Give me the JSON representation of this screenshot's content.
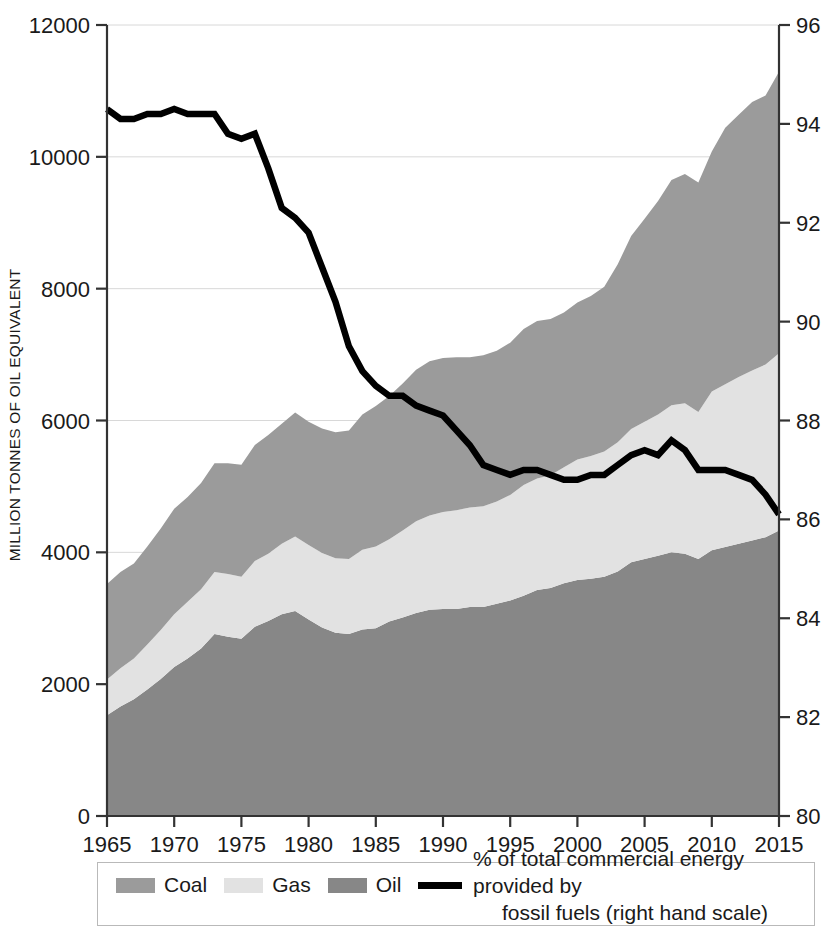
{
  "axes": {
    "left_title": "MILLION TONNES OF OIL EQUIVALENT",
    "left_ticks": [
      "0",
      "2000",
      "4000",
      "6000",
      "8000",
      "10000",
      "12000"
    ],
    "right_ticks": [
      "80",
      "82",
      "84",
      "86",
      "88",
      "90",
      "92",
      "94",
      "96"
    ],
    "x_ticks": [
      "1965",
      "1970",
      "1975",
      "1980",
      "1985",
      "1990",
      "1995",
      "2000",
      "2005",
      "2010",
      "2015"
    ]
  },
  "legend": {
    "coal_label": "Coal",
    "gas_label": "Gas",
    "oil_label": "Oil",
    "line_label_line1": "% of total commercial energy provided by",
    "line_label_line2": "fossil fuels (right hand scale)"
  },
  "colors": {
    "coal": "#9b9b9b",
    "gas": "#e2e2e2",
    "oil": "#878787",
    "line": "#000000",
    "axis": "#333333",
    "grid": "#d8d8d8"
  },
  "chart_data": {
    "type": "area",
    "title": "",
    "subtitle": "",
    "xlabel": "",
    "ylabel": "MILLION TONNES OF OIL EQUIVALENT",
    "y2label": "",
    "xlim": [
      1965,
      2015
    ],
    "ylim": [
      0,
      12000
    ],
    "y2lim": [
      80,
      96
    ],
    "grid": true,
    "legend_position": "bottom",
    "stacking": "stacked-area, bottom-to-top: Oil, Gas, Coal",
    "x": [
      1965,
      1966,
      1967,
      1968,
      1969,
      1970,
      1971,
      1972,
      1973,
      1974,
      1975,
      1976,
      1977,
      1978,
      1979,
      1980,
      1981,
      1982,
      1983,
      1984,
      1985,
      1986,
      1987,
      1988,
      1989,
      1990,
      1991,
      1992,
      1993,
      1994,
      1995,
      1996,
      1997,
      1998,
      1999,
      2000,
      2001,
      2002,
      2003,
      2004,
      2005,
      2006,
      2007,
      2008,
      2009,
      2010,
      2011,
      2012,
      2013,
      2014,
      2015
    ],
    "series": [
      {
        "name": "Oil",
        "color": "#878787",
        "values": [
          1530,
          1660,
          1770,
          1920,
          2080,
          2260,
          2390,
          2540,
          2760,
          2720,
          2690,
          2870,
          2960,
          3060,
          3110,
          2980,
          2860,
          2780,
          2760,
          2830,
          2850,
          2950,
          3010,
          3080,
          3130,
          3140,
          3140,
          3170,
          3170,
          3220,
          3270,
          3340,
          3430,
          3460,
          3530,
          3580,
          3600,
          3630,
          3710,
          3850,
          3900,
          3950,
          4000,
          3980,
          3900,
          4030,
          4080,
          4130,
          4180,
          4230,
          4330
        ]
      },
      {
        "name": "Gas",
        "color": "#e2e2e2",
        "values": [
          540,
          580,
          620,
          680,
          740,
          800,
          860,
          900,
          940,
          950,
          940,
          1000,
          1020,
          1070,
          1130,
          1130,
          1130,
          1130,
          1140,
          1210,
          1240,
          1250,
          1320,
          1390,
          1430,
          1470,
          1500,
          1510,
          1530,
          1550,
          1600,
          1680,
          1690,
          1710,
          1760,
          1830,
          1860,
          1900,
          1960,
          2020,
          2080,
          2140,
          2230,
          2280,
          2230,
          2410,
          2470,
          2530,
          2580,
          2620,
          2690
        ]
      },
      {
        "name": "Coal",
        "color": "#9b9b9b",
        "values": [
          1450,
          1460,
          1440,
          1490,
          1540,
          1600,
          1590,
          1610,
          1650,
          1680,
          1700,
          1760,
          1800,
          1820,
          1880,
          1870,
          1890,
          1910,
          1950,
          2050,
          2130,
          2170,
          2230,
          2300,
          2340,
          2340,
          2320,
          2280,
          2290,
          2290,
          2310,
          2370,
          2390,
          2370,
          2350,
          2380,
          2430,
          2500,
          2700,
          2930,
          3080,
          3240,
          3420,
          3480,
          3480,
          3640,
          3890,
          3980,
          4070,
          4080,
          4270
        ]
      }
    ],
    "line_series": {
      "name": "% of total commercial energy provided by fossil fuels (right hand scale)",
      "color": "#000000",
      "axis": "right",
      "values": [
        94.3,
        94.1,
        94.1,
        94.2,
        94.2,
        94.3,
        94.2,
        94.2,
        94.2,
        93.8,
        93.7,
        93.8,
        93.1,
        92.3,
        92.1,
        91.8,
        91.1,
        90.4,
        89.5,
        89.0,
        88.7,
        88.5,
        88.5,
        88.3,
        88.2,
        88.1,
        87.8,
        87.5,
        87.1,
        87.0,
        86.9,
        87.0,
        87.0,
        86.9,
        86.8,
        86.8,
        86.9,
        86.9,
        87.1,
        87.3,
        87.4,
        87.3,
        87.6,
        87.4,
        87.0,
        87.0,
        87.0,
        86.9,
        86.8,
        86.5,
        86.1
      ]
    }
  }
}
